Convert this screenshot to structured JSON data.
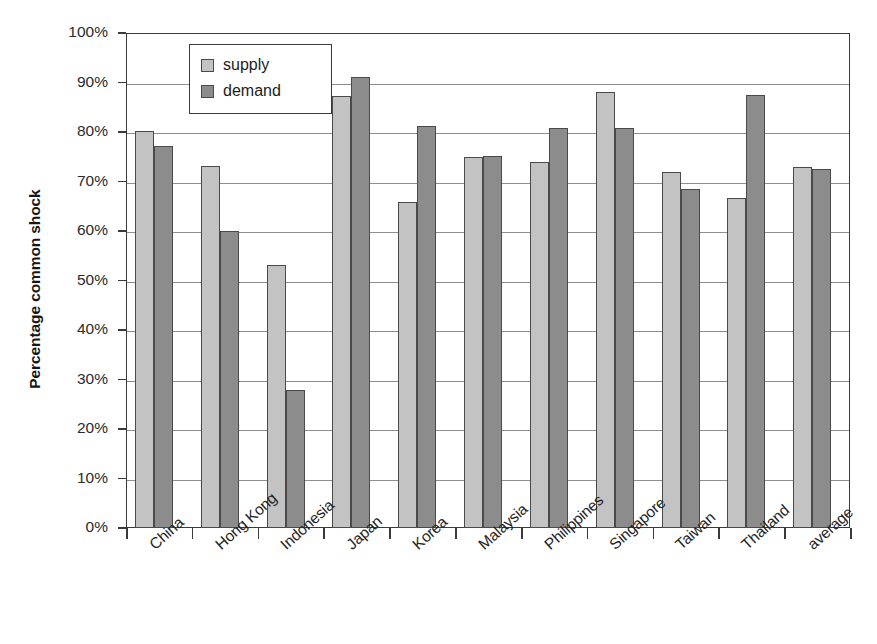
{
  "chart_data": {
    "type": "bar",
    "title": "",
    "xlabel": "",
    "ylabel": "Percentage common shock",
    "ylim": [
      0,
      100
    ],
    "grid": true,
    "legend_position": "top-left-inside",
    "ytick_labels": [
      "100%",
      "90%",
      "80%",
      "70%",
      "60%",
      "50%",
      "40%",
      "30%",
      "20%",
      "10%",
      "0%"
    ],
    "ytick_values": [
      100,
      90,
      80,
      70,
      60,
      50,
      40,
      30,
      20,
      10,
      0
    ],
    "categories": [
      "China",
      "Hong Kong",
      "Indonesia",
      "Japan",
      "Korea",
      "Malaysia",
      "Philippines",
      "Singapore",
      "Taiwan",
      "Thailand",
      "average"
    ],
    "series": [
      {
        "name": "supply",
        "color": "#c3c3c3",
        "values": [
          80.3,
          73.2,
          53.2,
          87.2,
          65.9,
          74.9,
          74.0,
          88.0,
          71.9,
          66.6,
          72.9
        ]
      },
      {
        "name": "demand",
        "color": "#8c8c8c",
        "values": [
          77.2,
          60.0,
          27.8,
          91.1,
          81.2,
          75.1,
          80.9,
          80.8,
          68.5,
          87.5,
          72.6
        ]
      }
    ]
  },
  "legend": {
    "entries": [
      {
        "label": "supply",
        "swatch": "supply"
      },
      {
        "label": "demand",
        "swatch": "demand"
      }
    ]
  },
  "axes": {
    "y_title": "Percentage common shock"
  },
  "caption": {
    "remnant": ""
  }
}
